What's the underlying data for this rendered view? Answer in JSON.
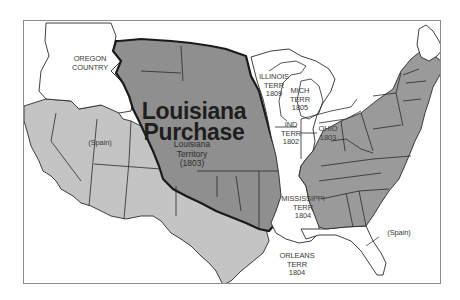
{
  "map": {
    "title_line1": "Louisiana",
    "title_line2": "Purchase",
    "subtitle_line1": "Louisiana",
    "subtitle_line2": "Territory",
    "subtitle_line3": "(1803)",
    "colors": {
      "louisiana_purchase": "#8f8f8f",
      "united_states": "#9a9a9a",
      "spanish_territory": "#c4c4c4",
      "unorganized_territory": "#ffffff",
      "border": "#2a2a2a",
      "frame": "#8a8a8a"
    },
    "regions": [
      {
        "id": "oregon",
        "lines": [
          "OREGON",
          "COUNTRY"
        ]
      },
      {
        "id": "spain-west",
        "lines": [
          "(Spain)"
        ]
      },
      {
        "id": "illinois",
        "lines": [
          "ILLINOIS",
          "TERR",
          "1809"
        ]
      },
      {
        "id": "michigan",
        "lines": [
          "MICH",
          "TERR",
          "1805"
        ]
      },
      {
        "id": "indiana",
        "lines": [
          "IND",
          "TERR",
          "1802"
        ]
      },
      {
        "id": "ohio",
        "lines": [
          "OHIO",
          "1803"
        ]
      },
      {
        "id": "mississippi",
        "lines": [
          "MISSISSIPPI",
          "TERR",
          "1804"
        ]
      },
      {
        "id": "orleans",
        "lines": [
          "ORLEANS",
          "TERR",
          "1804"
        ]
      },
      {
        "id": "spain-florida",
        "lines": [
          "(Spain)"
        ]
      }
    ]
  }
}
